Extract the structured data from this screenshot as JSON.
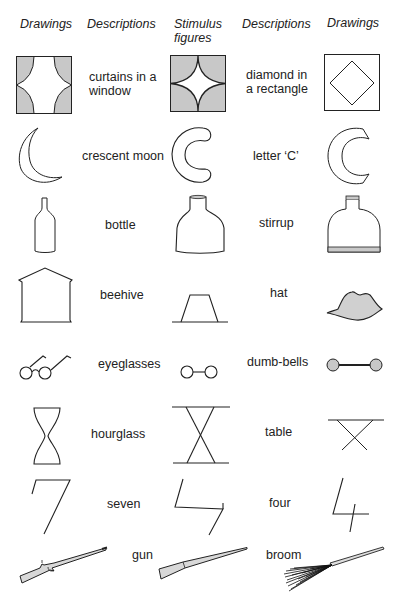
{
  "headers": {
    "col1": "Drawings",
    "col2": "Descriptions",
    "col3_line1": "Stimulus",
    "col3_line2": "figures",
    "col4": "Descriptions",
    "col5": "Drawings"
  },
  "rows": [
    {
      "left_description_line1": "curtains in a",
      "left_description_line2": "window",
      "right_description_line1": "diamond in",
      "right_description_line2": "a rectangle",
      "left_drawing": "curtains-window-icon",
      "stimulus": "curved-star-square-icon",
      "right_drawing": "diamond-rectangle-icon"
    },
    {
      "left_description": "crescent moon",
      "right_description": "letter ‘C’",
      "left_drawing": "crescent-moon-icon",
      "stimulus": "c-shape-icon",
      "right_drawing": "letter-c-icon"
    },
    {
      "left_description": "bottle",
      "right_description": "stirrup",
      "left_drawing": "bottle-icon",
      "stimulus": "jar-shape-icon",
      "right_drawing": "stirrup-icon"
    },
    {
      "left_description": "beehive",
      "right_description": "hat",
      "left_drawing": "beehive-icon",
      "stimulus": "trapezoid-icon",
      "right_drawing": "hat-icon"
    },
    {
      "left_description": "eyeglasses",
      "right_description": "dumb-bells",
      "left_drawing": "eyeglasses-icon",
      "stimulus": "two-circles-line-icon",
      "right_drawing": "dumbbell-icon"
    },
    {
      "left_description": "hourglass",
      "right_description": "table",
      "left_drawing": "hourglass-icon",
      "stimulus": "crossed-lines-bars-icon",
      "right_drawing": "table-icon"
    },
    {
      "left_description": "seven",
      "right_description": "four",
      "left_drawing": "seven-icon",
      "stimulus": "zigzag-icon",
      "right_drawing": "four-icon"
    },
    {
      "left_description": "gun",
      "right_description": "broom",
      "left_drawing": "gun-icon",
      "stimulus": "rod-icon",
      "right_drawing": "broom-icon"
    }
  ],
  "colors": {
    "stroke": "#222222",
    "fill_gray": "#c8c8c8",
    "background": "#ffffff"
  }
}
